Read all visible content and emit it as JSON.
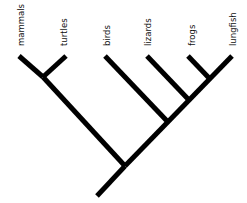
{
  "title": "",
  "taxa": [
    {
      "id": "mammals",
      "label": "mammals",
      "tip": [
        19,
        56
      ],
      "label_x": 21
    },
    {
      "id": "turtles",
      "label": "turtles",
      "tip": [
        66,
        56
      ],
      "label_x": 64
    },
    {
      "id": "birds",
      "label": "birds",
      "tip": [
        105,
        56
      ],
      "label_x": 107
    },
    {
      "id": "lizards",
      "label": "lizards",
      "tip": [
        147,
        56
      ],
      "label_x": 148
    },
    {
      "id": "frogs",
      "label": "frogs",
      "tip": [
        188,
        56
      ],
      "label_x": 192
    },
    {
      "id": "lungfish",
      "label": "lungfish",
      "tip": [
        232,
        56
      ],
      "label_x": 233
    }
  ],
  "nodes": {
    "mammals_turtles": [
      43,
      77
    ],
    "root": [
      125,
      166
    ],
    "base": [
      97,
      196
    ],
    "birds_join": [
      167,
      121
    ],
    "lizards_join": [
      188,
      99
    ],
    "frogs_join": [
      209,
      78
    ]
  },
  "branches": [
    {
      "from": "base",
      "to": "root"
    },
    {
      "from": "root",
      "to": "mammals_turtles"
    },
    {
      "from": "mammals_turtles",
      "to_tip": "mammals"
    },
    {
      "from": "mammals_turtles",
      "to_tip": "turtles"
    },
    {
      "from": "root",
      "to_tip": "lungfish"
    },
    {
      "from": "birds_join",
      "to_tip": "birds"
    },
    {
      "from": "lizards_join",
      "to_tip": "lizards"
    },
    {
      "from": "frogs_join",
      "to_tip": "frogs"
    }
  ],
  "colors": {
    "line": "#000000",
    "text": "#111111",
    "background": "#ffffff"
  }
}
